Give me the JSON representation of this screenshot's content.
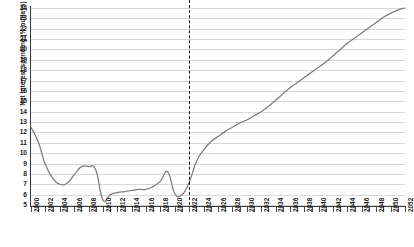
{
  "chart_data": {
    "type": "line",
    "title": "",
    "xlabel": "",
    "ylabel": "Net interest spending (% outlays)",
    "xlim": [
      2000,
      2052
    ],
    "ylim": [
      5,
      24
    ],
    "grid": true,
    "legend": "none",
    "y_ticks": [
      5,
      6,
      7,
      8,
      9,
      10,
      11,
      12,
      13,
      14,
      15,
      16,
      17,
      18,
      19,
      20,
      21,
      22,
      23,
      24
    ],
    "x_tick_labels": [
      2000,
      2002,
      2004,
      2006,
      2008,
      2010,
      2012,
      2014,
      2016,
      2018,
      2020,
      2022,
      2024,
      2026,
      2028,
      2030,
      2032,
      2034,
      2036,
      2038,
      2040,
      2042,
      2044,
      2046,
      2048,
      2050,
      2052
    ],
    "x_tick_step_minor": 1,
    "annotations": [
      {
        "name": "projection-divider",
        "type": "vline",
        "x": 2022,
        "style": "dashed",
        "color": "#111111"
      }
    ],
    "series": [
      {
        "name": "Net interest spending",
        "color": "#7d7d7d",
        "x": [
          2000,
          2001,
          2002,
          2003,
          2004,
          2005,
          2006,
          2007,
          2008,
          2009,
          2010,
          2011,
          2012,
          2013,
          2014,
          2015,
          2016,
          2017,
          2018,
          2019,
          2020,
          2021,
          2022,
          2023,
          2024,
          2025,
          2026,
          2027,
          2028,
          2029,
          2030,
          2031,
          2032,
          2033,
          2034,
          2035,
          2036,
          2037,
          2038,
          2039,
          2040,
          2041,
          2042,
          2043,
          2044,
          2045,
          2046,
          2047,
          2048,
          2049,
          2050,
          2051,
          2052
        ],
        "values": [
          12.5,
          11.1,
          8.9,
          7.6,
          7.0,
          7.1,
          7.9,
          8.7,
          8.7,
          8.4,
          5.5,
          6.0,
          6.2,
          6.3,
          6.4,
          6.5,
          6.5,
          6.8,
          7.3,
          8.2,
          6.1,
          6.0,
          7.2,
          9.2,
          10.3,
          11.1,
          11.6,
          12.1,
          12.5,
          12.9,
          13.2,
          13.6,
          14.0,
          14.5,
          15.1,
          15.7,
          16.3,
          16.8,
          17.3,
          17.8,
          18.3,
          18.8,
          19.4,
          20.0,
          20.6,
          21.1,
          21.6,
          22.1,
          22.6,
          23.1,
          23.5,
          23.8,
          24.0
        ]
      }
    ]
  }
}
